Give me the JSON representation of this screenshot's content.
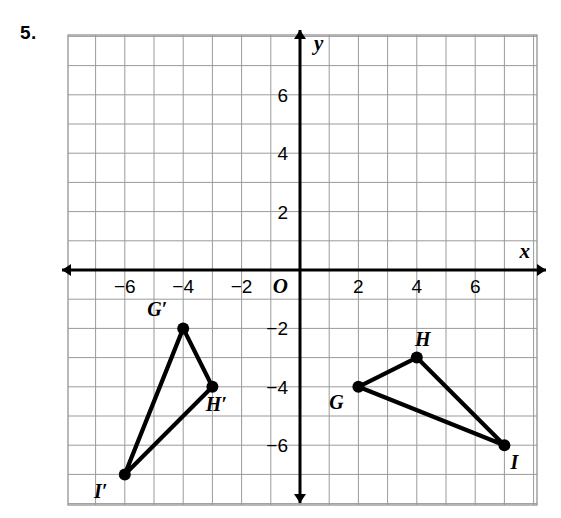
{
  "problem": {
    "number": "5."
  },
  "chart_data": {
    "type": "scatter",
    "title": "",
    "xlabel": "x",
    "ylabel": "y",
    "xlim": [
      -8,
      8.1
    ],
    "ylim": [
      -8,
      8
    ],
    "grid": true,
    "origin_label": "O",
    "xticks": [
      -6,
      -4,
      -2,
      2,
      4,
      6
    ],
    "xtick_labels": [
      "−6",
      "−4",
      "−2",
      "2",
      "4",
      "6"
    ],
    "yticks": [
      6,
      4,
      2,
      -2,
      -4,
      -6
    ],
    "ytick_labels": [
      "6",
      "4",
      "2",
      "−2",
      "−4",
      "−6"
    ],
    "legend": [],
    "series": [
      {
        "name": "Triangle GHI",
        "closed": true,
        "points": [
          {
            "label": "G",
            "x": 2,
            "y": -4,
            "label_dx": -22,
            "label_dy": 22
          },
          {
            "label": "H",
            "x": 4,
            "y": -3,
            "label_dx": 6,
            "label_dy": -12
          },
          {
            "label": "I",
            "x": 7,
            "y": -6,
            "label_dx": 10,
            "label_dy": 24
          }
        ]
      },
      {
        "name": "Triangle G'H'I'",
        "closed": true,
        "points": [
          {
            "label": "G′",
            "x": -4,
            "y": -2,
            "label_dx": -26,
            "label_dy": -12
          },
          {
            "label": "H′",
            "x": -3,
            "y": -4,
            "label_dx": 4,
            "label_dy": 24
          },
          {
            "label": "I′",
            "x": -6,
            "y": -7,
            "label_dx": -24,
            "label_dy": 24
          }
        ]
      }
    ],
    "colors": {
      "grid": "#9a9a9a",
      "axis": "#000000",
      "shape_stroke": "#000000",
      "vertex_fill": "#000000"
    }
  }
}
